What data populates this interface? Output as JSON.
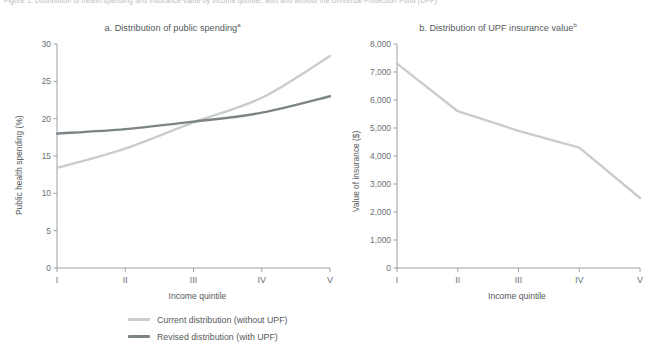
{
  "figure": {
    "caption": "Figure 1.  Distribution of health spending and insurance value by income quintile, with and without the Universal Protection Fund (UPF)"
  },
  "legend": {
    "position": "bottom-left",
    "items": [
      {
        "label": "Current distribution (without UPF)",
        "color": "#c9cdcb"
      },
      {
        "label": "Revised distribution (with UPF)",
        "color": "#7c8487"
      }
    ]
  },
  "chart_data": [
    {
      "id": "panel-a",
      "type": "line",
      "title": "a. Distribution of public spending",
      "title_superscript": "a",
      "xlabel": "Income quintile",
      "ylabel": "Public health spending (%)",
      "categories": [
        "I",
        "II",
        "III",
        "IV",
        "V"
      ],
      "ylim": [
        0,
        30
      ],
      "yticks": [
        0,
        5,
        10,
        15,
        20,
        25,
        30
      ],
      "ytick_labels": [
        "0",
        "5",
        "10",
        "15",
        "20",
        "25",
        "30"
      ],
      "grid": false,
      "series": [
        {
          "name": "Current distribution (without UPF)",
          "color": "#c9cdcb",
          "values": [
            13.4,
            16.0,
            19.5,
            22.8,
            28.4
          ]
        },
        {
          "name": "Revised distribution (with UPF)",
          "color": "#7c8487",
          "values": [
            18.0,
            18.6,
            19.6,
            20.8,
            23.0
          ]
        }
      ]
    },
    {
      "id": "panel-b",
      "type": "line",
      "title": "b. Distribution of UPF insurance value",
      "title_superscript": "b",
      "xlabel": "Income quintile",
      "ylabel": "Value of insurance ($)",
      "categories": [
        "I",
        "II",
        "III",
        "IV",
        "V"
      ],
      "ylim": [
        0,
        8000
      ],
      "yticks": [
        0,
        1000,
        2000,
        3000,
        4000,
        5000,
        6000,
        7000,
        8000
      ],
      "ytick_labels": [
        "0",
        "1,000",
        "2,000",
        "3,000",
        "4,000",
        "5,000",
        "6,000",
        "7,000",
        "8,000"
      ],
      "grid": false,
      "series": [
        {
          "name": "Current distribution (without UPF)",
          "color": "#c9cdcb",
          "values": [
            7300,
            5600,
            4900,
            4300,
            2500
          ]
        }
      ]
    }
  ]
}
